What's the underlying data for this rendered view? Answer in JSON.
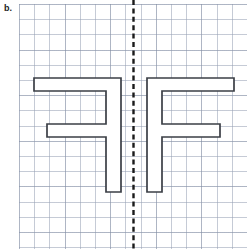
{
  "worksheet": {
    "problem_label": "b.",
    "task_type": "line-of-symmetry-reflection"
  },
  "colors": {
    "background": "#ffffff",
    "grid_minor_line": "#96a0b4",
    "grid_major_line": "#78849b",
    "shape_stroke": "#3b3f46",
    "shape_fill": "#ffffff",
    "symmetry_line": "#1a1a1a",
    "label_text": "#222222"
  },
  "grid": {
    "origin_x": 19,
    "origin_y": 4,
    "width": 228,
    "height": 245,
    "cell_size": 15.2,
    "major_every": 3,
    "columns": 15,
    "rows": 16
  },
  "symmetry_line": {
    "name": "line-of-symmetry",
    "orientation": "vertical",
    "x": 133.5,
    "y_start": 0,
    "y_end": 249,
    "stroke_width": 2.4,
    "dash": "5,3.4"
  },
  "figures": [
    {
      "name": "mirrored-f-shape",
      "side": "left",
      "description": "Reflected letter F, reversed horizontally",
      "points": "34,78 121,78 121,192 106,192 106,137 47,137 47,124 106,124 106,91 34,91"
    },
    {
      "name": "f-shape",
      "side": "right",
      "description": "Letter F outline",
      "points": "234,78 234,91 162,91 162,124 220,124 220,137 162,137 162,192 147,192 147,78"
    }
  ]
}
